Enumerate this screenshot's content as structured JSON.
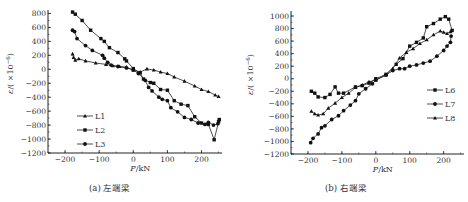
{
  "captions": {
    "a": "(a) 左端梁",
    "b": "(b) 右端梁"
  },
  "chart_data": [
    {
      "type": "line",
      "title": "(a) 左端梁",
      "xlabel": "P/kN",
      "ylabel": "ε/(×10⁻⁶)",
      "xlim": [
        -250,
        260
      ],
      "ylim": [
        -1200,
        850
      ],
      "xticks": [
        -200,
        -100,
        0,
        100,
        200
      ],
      "yticks": [
        800,
        600,
        400,
        200,
        0,
        -200,
        -400,
        -600,
        -800,
        -1000,
        -1200
      ],
      "legend_position": "lower-left inside",
      "grid": false,
      "series": [
        {
          "name": "L1",
          "marker": "triangle",
          "points": [
            [
              -178,
              220
            ],
            [
              -175,
              170
            ],
            [
              -170,
              130
            ],
            [
              -160,
              150
            ],
            [
              -140,
              120
            ],
            [
              -110,
              90
            ],
            [
              -80,
              70
            ],
            [
              -60,
              50
            ],
            [
              -40,
              40
            ],
            [
              -20,
              30
            ],
            [
              0,
              -10
            ],
            [
              20,
              -40
            ],
            [
              40,
              5
            ],
            [
              60,
              -10
            ],
            [
              80,
              -40
            ],
            [
              100,
              -60
            ],
            [
              120,
              -110
            ],
            [
              150,
              -170
            ],
            [
              180,
              -240
            ],
            [
              200,
              -290
            ],
            [
              220,
              -320
            ],
            [
              240,
              -370
            ],
            [
              250,
              -390
            ]
          ]
        },
        {
          "name": "L2",
          "marker": "square",
          "points": [
            [
              -178,
              820
            ],
            [
              -170,
              790
            ],
            [
              -150,
              700
            ],
            [
              -125,
              560
            ],
            [
              -95,
              440
            ],
            [
              -85,
              400
            ],
            [
              -70,
              310
            ],
            [
              -45,
              240
            ],
            [
              -25,
              150
            ],
            [
              -20,
              120
            ],
            [
              0,
              10
            ],
            [
              20,
              -50
            ],
            [
              30,
              -140
            ],
            [
              50,
              -190
            ],
            [
              60,
              -200
            ],
            [
              80,
              -290
            ],
            [
              100,
              -300
            ],
            [
              120,
              -450
            ],
            [
              140,
              -500
            ],
            [
              160,
              -520
            ],
            [
              180,
              -680
            ],
            [
              200,
              -770
            ],
            [
              220,
              -790
            ],
            [
              237,
              -1010
            ],
            [
              250,
              -750
            ],
            [
              252,
              -720
            ]
          ]
        },
        {
          "name": "L3",
          "marker": "circle",
          "points": [
            [
              -178,
              560
            ],
            [
              -172,
              540
            ],
            [
              -165,
              440
            ],
            [
              -140,
              340
            ],
            [
              -120,
              270
            ],
            [
              -90,
              200
            ],
            [
              -85,
              160
            ],
            [
              -75,
              100
            ],
            [
              -65,
              60
            ],
            [
              -45,
              40
            ],
            [
              -20,
              20
            ],
            [
              0,
              -10
            ],
            [
              15,
              -60
            ],
            [
              35,
              -160
            ],
            [
              45,
              -260
            ],
            [
              55,
              -310
            ],
            [
              75,
              -400
            ],
            [
              85,
              -430
            ],
            [
              100,
              -450
            ],
            [
              110,
              -550
            ],
            [
              130,
              -610
            ],
            [
              150,
              -690
            ],
            [
              170,
              -720
            ],
            [
              190,
              -770
            ],
            [
              210,
              -790
            ],
            [
              220,
              -760
            ],
            [
              235,
              -800
            ],
            [
              248,
              -780
            ]
          ]
        }
      ]
    },
    {
      "type": "line",
      "title": "(b) 右端梁",
      "xlabel": "P/kN",
      "ylabel": "ε/(×10⁻⁶)",
      "xlim": [
        -250,
        260
      ],
      "ylim": [
        -1200,
        1080
      ],
      "xticks": [
        -200,
        -100,
        0,
        100,
        200
      ],
      "yticks": [
        1000,
        800,
        600,
        400,
        200,
        0,
        -200,
        -400,
        -600,
        -800,
        -1000,
        -1200
      ],
      "legend_position": "right inside",
      "grid": false,
      "series": [
        {
          "name": "L6",
          "marker": "square",
          "points": [
            [
              -190,
              -200
            ],
            [
              -180,
              -230
            ],
            [
              -170,
              -290
            ],
            [
              -150,
              -300
            ],
            [
              -135,
              -250
            ],
            [
              -120,
              -130
            ],
            [
              -110,
              -230
            ],
            [
              -95,
              -230
            ],
            [
              -60,
              -130
            ],
            [
              -40,
              -110
            ],
            [
              -20,
              -70
            ],
            [
              0,
              0
            ],
            [
              30,
              70
            ],
            [
              60,
              230
            ],
            [
              80,
              320
            ],
            [
              100,
              520
            ],
            [
              120,
              580
            ],
            [
              140,
              650
            ],
            [
              150,
              830
            ],
            [
              170,
              880
            ],
            [
              190,
              950
            ],
            [
              205,
              990
            ],
            [
              215,
              950
            ],
            [
              225,
              770
            ]
          ]
        },
        {
          "name": "L7",
          "marker": "circle",
          "points": [
            [
              -192,
              -1020
            ],
            [
              -185,
              -950
            ],
            [
              -170,
              -880
            ],
            [
              -160,
              -780
            ],
            [
              -150,
              -750
            ],
            [
              -130,
              -650
            ],
            [
              -110,
              -590
            ],
            [
              -95,
              -510
            ],
            [
              -75,
              -420
            ],
            [
              -60,
              -350
            ],
            [
              -50,
              -240
            ],
            [
              -30,
              -160
            ],
            [
              -10,
              -80
            ],
            [
              0,
              -20
            ],
            [
              30,
              60
            ],
            [
              50,
              130
            ],
            [
              70,
              160
            ],
            [
              85,
              160
            ],
            [
              100,
              200
            ],
            [
              120,
              220
            ],
            [
              140,
              250
            ],
            [
              160,
              280
            ],
            [
              180,
              360
            ],
            [
              200,
              450
            ],
            [
              210,
              520
            ],
            [
              220,
              580
            ],
            [
              222,
              680
            ]
          ]
        },
        {
          "name": "L8",
          "marker": "triangle",
          "points": [
            [
              -190,
              -520
            ],
            [
              -180,
              -560
            ],
            [
              -170,
              -580
            ],
            [
              -155,
              -560
            ],
            [
              -140,
              -470
            ],
            [
              -120,
              -390
            ],
            [
              -100,
              -300
            ],
            [
              -80,
              -230
            ],
            [
              -60,
              -140
            ],
            [
              -40,
              -100
            ],
            [
              -20,
              -50
            ],
            [
              0,
              -20
            ],
            [
              30,
              60
            ],
            [
              50,
              160
            ],
            [
              70,
              330
            ],
            [
              90,
              420
            ],
            [
              110,
              480
            ],
            [
              130,
              560
            ],
            [
              150,
              620
            ],
            [
              170,
              700
            ],
            [
              190,
              760
            ],
            [
              200,
              740
            ],
            [
              210,
              720
            ],
            [
              220,
              750
            ]
          ]
        }
      ]
    }
  ]
}
